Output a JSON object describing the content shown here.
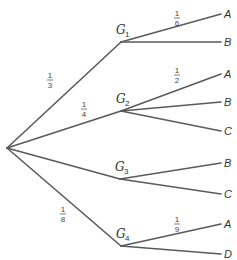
{
  "diagram": {
    "type": "probability-tree",
    "root": {
      "label": ""
    },
    "stages": [
      {
        "node": "G",
        "subscript": "1",
        "probability": {
          "num": "1",
          "den": "3"
        },
        "leaves": [
          {
            "label": "A",
            "probability": {
              "num": "1",
              "den": "6"
            }
          },
          {
            "label": "B",
            "probability": null
          }
        ]
      },
      {
        "node": "G",
        "subscript": "2",
        "probability": {
          "num": "1",
          "den": "4"
        },
        "leaves": [
          {
            "label": "A",
            "probability": {
              "num": "1",
              "den": "2"
            }
          },
          {
            "label": "B",
            "probability": null
          },
          {
            "label": "C",
            "probability": null
          }
        ]
      },
      {
        "node": "G",
        "subscript": "3",
        "probability": null,
        "leaves": [
          {
            "label": "B",
            "probability": null
          },
          {
            "label": "C",
            "probability": null
          }
        ]
      },
      {
        "node": "G",
        "subscript": "4",
        "probability": {
          "num": "1",
          "den": "8"
        },
        "leaves": [
          {
            "label": "A",
            "probability": {
              "num": "1",
              "den": "9"
            }
          },
          {
            "label": "D",
            "probability": null
          }
        ]
      }
    ],
    "colors": {
      "line": "#5a5a5a",
      "text": "#333333"
    }
  }
}
